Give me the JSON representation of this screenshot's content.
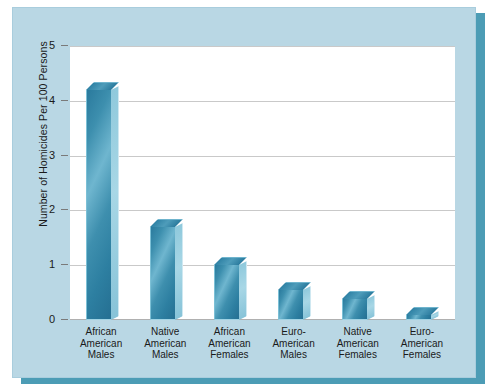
{
  "chart_data": {
    "type": "bar",
    "title": "",
    "xlabel": "",
    "ylabel": "Number of Homicides Per 100 Persons",
    "ylim": [
      0,
      5
    ],
    "yticks": [
      "0",
      "1",
      "2",
      "3",
      "4",
      "5"
    ],
    "grid": true,
    "legend": "none",
    "style": "3d-bars",
    "categories": [
      "African American Males",
      "Native American Males",
      "African American Females",
      "Euro-American Males",
      "Native American Females",
      "Euro-American Females"
    ],
    "category_lines": [
      [
        "African",
        "American",
        "Males"
      ],
      [
        "Native",
        "American",
        "Males"
      ],
      [
        "African",
        "American",
        "Females"
      ],
      [
        "Euro-",
        "American",
        "Males"
      ],
      [
        "Native",
        "American",
        "Females"
      ],
      [
        "Euro-",
        "American",
        "Females"
      ]
    ],
    "values": [
      4.2,
      1.7,
      1.0,
      0.55,
      0.38,
      0.1
    ]
  },
  "colors": {
    "panel_background": "#b9d7e4",
    "shadow": "#4c9cb5",
    "plot_background": "#ffffff",
    "bar_front": "#2e7fa0",
    "bar_highlight": "#6fb6cf",
    "bar_side": "#a8d7e6",
    "gridline": "#c9c9c9",
    "text": "#1a1a1a"
  }
}
